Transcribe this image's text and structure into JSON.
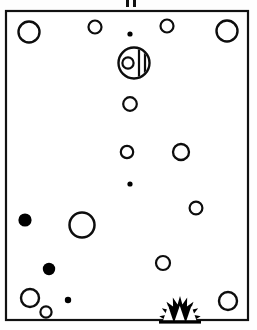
{
  "figure": {
    "title": "Scatter of circular markers within a rectangular frame",
    "background_color": "#fefefe",
    "ink_color": "#000000",
    "canvas": {
      "width": 257,
      "height": 330
    }
  },
  "frame": {
    "name": "panel-border",
    "x": 6,
    "y": 11,
    "width": 242,
    "height": 309,
    "stroke_width": 2.2,
    "stroke_color": "#111111",
    "fill_color": "#ffffff"
  },
  "top_marks": {
    "name": "top-tick-marks",
    "count": 2,
    "color": "#111111",
    "items": [
      {
        "x": 126,
        "y": 0,
        "width": 3,
        "height": 7
      },
      {
        "x": 133,
        "y": 0,
        "width": 3,
        "height": 7
      }
    ]
  },
  "markers": {
    "count": 20,
    "open_stroke_color": "#0d0d0d",
    "filled_color": "#000000",
    "items": [
      {
        "name": "circle-open-top-left",
        "cx": 29,
        "cy": 32,
        "r": 10.5,
        "style": "open",
        "stroke": 2.4
      },
      {
        "name": "circle-open-top-mid-left",
        "cx": 95,
        "cy": 27,
        "r": 6.5,
        "style": "open",
        "stroke": 2.2
      },
      {
        "name": "dot-top-center",
        "cx": 130,
        "cy": 34,
        "r": 2.6,
        "style": "filled",
        "stroke": 0
      },
      {
        "name": "circle-open-top-mid-right",
        "cx": 167,
        "cy": 26,
        "r": 6.5,
        "style": "open",
        "stroke": 2.2
      },
      {
        "name": "circle-open-top-right",
        "cx": 227,
        "cy": 31,
        "r": 10.5,
        "style": "open",
        "stroke": 2.4
      },
      {
        "name": "circle-open-upper-center",
        "cx": 130,
        "cy": 104,
        "r": 6.8,
        "style": "open",
        "stroke": 2.2
      },
      {
        "name": "circle-open-mid-center",
        "cx": 127,
        "cy": 152,
        "r": 6.2,
        "style": "open",
        "stroke": 2.2
      },
      {
        "name": "circle-open-mid-right",
        "cx": 181,
        "cy": 152,
        "r": 8.0,
        "style": "open",
        "stroke": 2.3
      },
      {
        "name": "dot-mid-center",
        "cx": 130,
        "cy": 184,
        "r": 2.6,
        "style": "filled",
        "stroke": 0
      },
      {
        "name": "circle-open-lower-right",
        "cx": 196,
        "cy": 208,
        "r": 6.4,
        "style": "open",
        "stroke": 2.2
      },
      {
        "name": "dot-left-large",
        "cx": 25,
        "cy": 220,
        "r": 6.6,
        "style": "filled",
        "stroke": 0
      },
      {
        "name": "circle-open-left-large",
        "cx": 82,
        "cy": 225,
        "r": 12.5,
        "style": "open",
        "stroke": 2.5
      },
      {
        "name": "circle-open-bottom-mid",
        "cx": 163,
        "cy": 263,
        "r": 7.0,
        "style": "open",
        "stroke": 2.2
      },
      {
        "name": "dot-bottom-left",
        "cx": 49,
        "cy": 269,
        "r": 6.2,
        "style": "filled",
        "stroke": 0
      },
      {
        "name": "circle-open-bottom-left",
        "cx": 30,
        "cy": 298,
        "r": 9.0,
        "style": "open",
        "stroke": 2.4
      },
      {
        "name": "circle-open-bottom-tiny",
        "cx": 46,
        "cy": 312,
        "r": 5.6,
        "style": "open",
        "stroke": 2.2
      },
      {
        "name": "dot-bottom-center-small",
        "cx": 68,
        "cy": 300,
        "r": 3.2,
        "style": "filled",
        "stroke": 0
      },
      {
        "name": "circle-open-bottom-right",
        "cx": 228,
        "cy": 301,
        "r": 9.0,
        "style": "open",
        "stroke": 2.4
      }
    ]
  },
  "disc_emblem": {
    "name": "composite-disc-emblem",
    "cx": 134,
    "cy": 63,
    "r": 15.5,
    "stroke": 2.4,
    "inner_circle": {
      "cx": 128,
      "cy": 63,
      "r": 5.6,
      "stroke": 2.2
    },
    "bar": {
      "x1": 139,
      "x2": 145,
      "y_top": 49,
      "y_bottom": 78,
      "stroke": 2.2
    }
  },
  "burst_emblem": {
    "name": "sunburst-emblem",
    "cx": 180,
    "cy": 312,
    "width": 42,
    "height": 28,
    "spike_count": 9,
    "notch_count": 3,
    "fill_color": "#000000"
  }
}
